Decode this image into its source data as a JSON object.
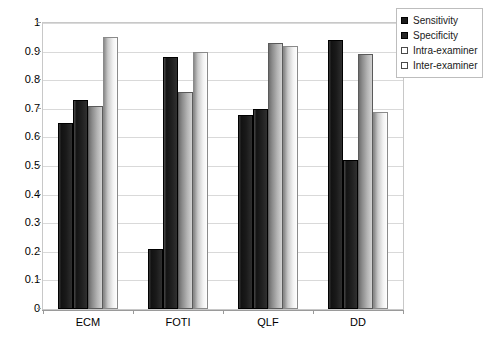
{
  "chart_data": {
    "type": "bar",
    "title": "",
    "subtitle": "",
    "xlabel": "",
    "ylabel": "",
    "categories": [
      "ECM",
      "FOTI",
      "QLF",
      "DD"
    ],
    "series": [
      {
        "name": "Sensitivity",
        "values": [
          0.65,
          0.21,
          0.68,
          0.94
        ]
      },
      {
        "name": "Specificity",
        "values": [
          0.73,
          0.88,
          0.7,
          0.52
        ]
      },
      {
        "name": "Intra-examiner",
        "values": [
          0.71,
          0.76,
          0.93,
          0.89
        ]
      },
      {
        "name": "Inter-examiner",
        "values": [
          0.95,
          0.9,
          0.92,
          0.69
        ]
      }
    ],
    "ylim": [
      0,
      1
    ],
    "ytick_values": [
      0,
      0.1,
      0.2,
      0.3,
      0.4,
      0.5,
      0.6,
      0.7,
      0.8,
      0.9,
      1
    ],
    "ytick_labels": [
      "0",
      "0.1",
      "0.2",
      "0.3",
      "0.4",
      "0.5",
      "0.6",
      "0.7",
      "0.8",
      "0.9",
      "1"
    ],
    "grid": "horizontal",
    "legend_position": "top-right",
    "colors": {
      "series_0": "#1c1c1c",
      "series_1": "#262626",
      "series_2": "#b5b5b5",
      "series_3": "#f2f2f2",
      "gridline": "#d9d9d9",
      "frame": "#c8c8c8",
      "background": "#ffffff",
      "text": "#000000"
    }
  },
  "legend": {
    "items": [
      {
        "label": "Sensitivity"
      },
      {
        "label": "Specificity"
      },
      {
        "label": "Intra-examiner"
      },
      {
        "label": "Inter-examiner"
      }
    ]
  }
}
